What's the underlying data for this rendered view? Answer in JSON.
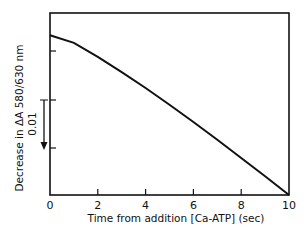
{
  "chart_data": {
    "type": "line",
    "title": "",
    "xlabel": "Time from addition [Ca-ATP] (sec)",
    "ylabel": "Decrease in ΔA 580/630 nm",
    "x_ticks": [
      "0",
      "2",
      "4",
      "6",
      "8",
      "10"
    ],
    "xlim": [
      0,
      10
    ],
    "ylim": [
      0,
      0.038
    ],
    "grid": false,
    "scale_bar": {
      "label": "0.01",
      "value": 0.01,
      "direction": "down"
    },
    "series": [
      {
        "name": "ΔA 580/630 nm",
        "x": [
          0,
          1,
          2,
          3,
          4,
          5,
          6,
          7,
          8,
          9,
          10
        ],
        "values": [
          0.0333,
          0.0317,
          0.0288,
          0.0256,
          0.0223,
          0.0188,
          0.0152,
          0.0115,
          0.0077,
          0.0039,
          0.0
        ]
      }
    ]
  }
}
